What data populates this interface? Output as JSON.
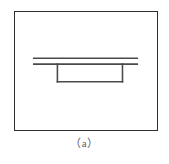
{
  "figure": {
    "caption": "（a）",
    "panel_label": "a",
    "frame": {
      "x": 14,
      "y": 11,
      "width": 144,
      "height": 120,
      "stroke_color": "#2e2e31",
      "stroke_width": 1.6,
      "fill_color": "#ffffff"
    },
    "background_color": "#ffffff",
    "line_color": "#4a4a4e",
    "caption_color": "#5a5a5e"
  },
  "drawing_data": {
    "type": "line-drawing",
    "description": "Profile view of a slab supported by a rectangular pedestal",
    "elements": [
      {
        "name": "upper-slab-line",
        "type": "line",
        "x1": 19,
        "y1": 47,
        "x2": 124,
        "y2": 47
      },
      {
        "name": "lower-slab-line",
        "type": "line",
        "x1": 19,
        "y1": 53,
        "x2": 124,
        "y2": 53
      },
      {
        "name": "pedestal-left-wall",
        "type": "line",
        "x1": 43,
        "y1": 53,
        "x2": 43,
        "y2": 71
      },
      {
        "name": "pedestal-right-wall",
        "type": "line",
        "x1": 109,
        "y1": 53,
        "x2": 109,
        "y2": 71
      },
      {
        "name": "pedestal-bottom",
        "type": "line",
        "x1": 43,
        "y1": 71,
        "x2": 109,
        "y2": 71
      }
    ]
  }
}
